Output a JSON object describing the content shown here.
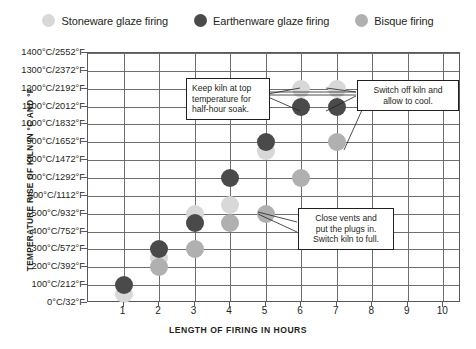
{
  "legend": {
    "items": [
      {
        "label": "Stoneware glaze firing",
        "color": "#d8d8d8",
        "key": "stoneware"
      },
      {
        "label": "Earthenware glaze firing",
        "color": "#4a4a4a",
        "key": "earthenware"
      },
      {
        "label": "Bisque firing",
        "color": "#b0b0b0",
        "key": "bisque"
      }
    ]
  },
  "chart_data": {
    "type": "scatter",
    "title": "",
    "xlabel": "LENGTH OF FIRING IN HOURS",
    "ylabel": "TEMPERATURE RISE OF KILN IN °C AND °F",
    "xlim": [
      0,
      10.5
    ],
    "ylim": [
      0,
      1400
    ],
    "grid": true,
    "legend_position": "top-center",
    "x_ticks": [
      1,
      2,
      3,
      4,
      5,
      6,
      7,
      8,
      9,
      10
    ],
    "y_ticks": [
      0,
      100,
      200,
      300,
      400,
      500,
      600,
      700,
      800,
      900,
      1000,
      1100,
      1200,
      1300,
      1400
    ],
    "y_tick_labels": [
      "0°C/32°F",
      "100°C/212°F",
      "200°C/392°F",
      "300°C/572°F",
      "400°C/752°F",
      "500°C/932°F",
      "600°C/1112°F",
      "700°C/1292°F",
      "800°C/1472°F",
      "900°C/1652°F",
      "1000°C/1832°F",
      "1100°C/2012°F",
      "1200°C/2192°F",
      "1300°C/2372°F",
      "1400°C/2552°F"
    ],
    "series": [
      {
        "name": "Stoneware glaze firing",
        "color": "#d8d8d8",
        "radius": 9,
        "points": [
          {
            "x": 1,
            "y": 50
          },
          {
            "x": 2,
            "y": 250
          },
          {
            "x": 3,
            "y": 500
          },
          {
            "x": 4,
            "y": 550
          },
          {
            "x": 5,
            "y": 850
          },
          {
            "x": 6,
            "y": 1200
          },
          {
            "x": 7,
            "y": 1200
          }
        ]
      },
      {
        "name": "Earthenware glaze firing",
        "color": "#4a4a4a",
        "radius": 9,
        "points": [
          {
            "x": 1,
            "y": 100
          },
          {
            "x": 2,
            "y": 300
          },
          {
            "x": 3,
            "y": 450
          },
          {
            "x": 4,
            "y": 700
          },
          {
            "x": 5,
            "y": 900
          },
          {
            "x": 6,
            "y": 1100
          },
          {
            "x": 7,
            "y": 1100
          }
        ]
      },
      {
        "name": "Bisque firing",
        "color": "#b0b0b0",
        "radius": 9,
        "points": [
          {
            "x": 2,
            "y": 200
          },
          {
            "x": 3,
            "y": 300
          },
          {
            "x": 4,
            "y": 450
          },
          {
            "x": 5,
            "y": 500
          },
          {
            "x": 6,
            "y": 700
          },
          {
            "x": 7,
            "y": 900
          }
        ]
      }
    ],
    "annotations": [
      {
        "id": "soak-note",
        "lines": [
          "Keep kiln at top",
          "temperature for",
          "half-hour soak."
        ],
        "align": "left"
      },
      {
        "id": "switch-off-note",
        "lines": [
          "Switch off kiln and",
          "allow to cool."
        ],
        "align": "center"
      },
      {
        "id": "close-vents-note",
        "lines": [
          "Close vents and",
          "put the plugs in.",
          "Switch kiln to full."
        ],
        "align": "center"
      }
    ]
  }
}
